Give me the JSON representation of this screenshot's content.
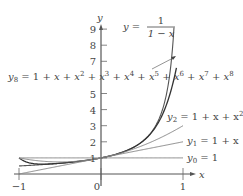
{
  "chart_data": {
    "type": "line",
    "title": "",
    "xlabel": "x",
    "ylabel": "y",
    "xlim": [
      -1,
      1
    ],
    "ylim": [
      0,
      9
    ],
    "grid": false,
    "x_ticks": [
      {
        "value": -1,
        "label": "−1"
      },
      {
        "value": 0,
        "label": "0"
      },
      {
        "value": 1,
        "label": "1"
      }
    ],
    "y_ticks": [
      {
        "value": 1,
        "label": "1"
      },
      {
        "value": 2,
        "label": "2"
      },
      {
        "value": 3,
        "label": "3"
      },
      {
        "value": 4,
        "label": "4"
      },
      {
        "value": 5,
        "label": "5"
      },
      {
        "value": 7,
        "label": "7"
      },
      {
        "value": 8,
        "label": "8"
      },
      {
        "value": 9,
        "label": "9"
      }
    ],
    "series": [
      {
        "name": "y = 1/(1−x)",
        "kind": "geometric",
        "domain": [
          -1,
          0.89
        ],
        "color": "#555555",
        "width": 1.1
      },
      {
        "name": "y8 = 1 + x + x^2 + x^3 + x^4 + x^5 + x^6 + x^7 + x^8",
        "kind": "poly",
        "degree": 8,
        "domain": [
          -1,
          0.92
        ],
        "color": "#333333",
        "width": 1.3
      },
      {
        "name": "y2 = 1 + x + x^2",
        "kind": "poly",
        "degree": 2,
        "domain": [
          -1,
          1
        ],
        "color": "#888888",
        "width": 1
      },
      {
        "name": "y1 = 1 + x",
        "kind": "poly",
        "degree": 1,
        "domain": [
          -1,
          1
        ],
        "color": "#888888",
        "width": 1
      },
      {
        "name": "y0 = 1",
        "kind": "poly",
        "degree": 0,
        "domain": [
          -1,
          1
        ],
        "color": "#888888",
        "width": 1
      }
    ],
    "annotations": [
      {
        "text_parts": [
          "y = ",
          "1",
          "1 − x"
        ],
        "target": "1/(1−x)"
      },
      {
        "text": "y8 = 1 + x + x2 + x3 + x4 + x5 + x6 + x7 + x8",
        "target": "y8",
        "arrow": true
      },
      {
        "text": "y2 = 1 + x + x2"
      },
      {
        "text": "y1 = 1 + x"
      },
      {
        "text": "y0 = 1"
      }
    ]
  },
  "labels": {
    "x_axis": "x",
    "y_axis": "y",
    "geom_y": "y =",
    "geom_num": "1",
    "geom_den": "1 − x",
    "y8_prefix": "y",
    "y8_sub": "8",
    "y8_rhs": " = 1 + x + x",
    "y2_lbl_sub": "2",
    "y1_lbl_sub": "1",
    "y0_lbl_sub": "0",
    "y2_rhs": " = 1 + x + x",
    "y1_rhs": " = 1 + x",
    "y0_rhs": " = 1"
  }
}
